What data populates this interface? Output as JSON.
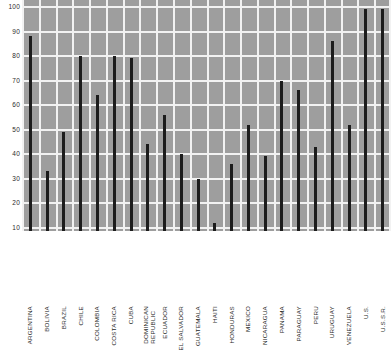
{
  "chart_data": {
    "type": "bar",
    "title": "",
    "xlabel": "",
    "ylabel": "",
    "ylim": [
      8,
      102
    ],
    "grid": true,
    "legend": false,
    "y_ticks": [
      100,
      90,
      80,
      70,
      60,
      50,
      40,
      30,
      20,
      10
    ],
    "categories": [
      "ARGENTINA",
      "BOLIVIA",
      "BRAZIL",
      "CHILE",
      "COLOMBIA",
      "COSTA RICA",
      "CUBA",
      "DOMINICAN REPUBLIC",
      "ECUADOR",
      "EL SALVADOR",
      "GUATEMALA",
      "HAITI",
      "HONDURAS",
      "MEXICO",
      "NICARAGUA",
      "PANAMA",
      "PARAGUAY",
      "PERU",
      "URUGUAY",
      "VENEZUELA",
      "U.S.",
      "U.S.S.R."
    ],
    "values": [
      88,
      33,
      49,
      80,
      64,
      80,
      79,
      44,
      56,
      40,
      30,
      12,
      36,
      52,
      39,
      70,
      66,
      43,
      86,
      52,
      99,
      99
    ]
  },
  "colors": {
    "plot_background": "#9e9e9e",
    "gridline": "#f2f2f2",
    "bar": "#1c1c1c",
    "page_background": "#ffffff",
    "text": "#1f1f1f"
  }
}
